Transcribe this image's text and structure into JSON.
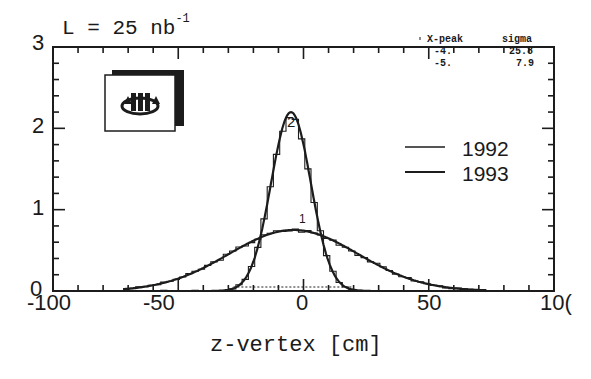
{
  "chart_data": {
    "type": "line",
    "title_main": "L = 25 nb",
    "title_sup": "-1",
    "xlabel": "z-vertex [cm]",
    "ylabel": "",
    "xlim": [
      -100,
      100
    ],
    "ylim": [
      0,
      3
    ],
    "x_ticks": [
      "-100",
      "-50",
      "0",
      "50",
      "10("
    ],
    "y_ticks": [
      "0",
      "1",
      "2",
      "3"
    ],
    "grid": false,
    "legend_position": "right-middle",
    "legend": [
      {
        "label": "1992",
        "style": "solid"
      },
      {
        "label": "1993",
        "style": "solid"
      }
    ],
    "series": [
      {
        "name": "1992",
        "curve_label": "1",
        "fit": "gaussian",
        "x_peak": -4,
        "sigma": 25.8,
        "peak_height": 0.75,
        "histogram": true
      },
      {
        "name": "1993",
        "curve_label": "2",
        "fit": "gaussian",
        "x_peak": -5,
        "sigma": 7.9,
        "peak_height": 2.2,
        "histogram": true
      }
    ],
    "stats_box": {
      "headers": [
        "X-peak",
        "sigma"
      ],
      "rows": [
        [
          "-4.",
          "25.8"
        ],
        [
          "-5.",
          "7.9"
        ]
      ]
    }
  },
  "labels": {
    "title_main": "L = 25 nb",
    "title_sup": "-1",
    "xlabel": "z-vertex [cm]",
    "y0": "0",
    "y1": "1",
    "y2": "2",
    "y3": "3",
    "xm100": "-100",
    "xm50": "-50",
    "x0": "0",
    "x50": "50",
    "x100": "10(",
    "legend1": "1992",
    "legend2": "1993",
    "curve1": "1",
    "curve2": "2",
    "stat_h1": "X-peak",
    "stat_h2": "sigma",
    "stat_r1c1": "-4.",
    "stat_r1c2": "25.8",
    "stat_r2c1": "-5.",
    "stat_r2c2": "7.9"
  },
  "logo": {
    "icon": "h1-experiment-logo"
  }
}
